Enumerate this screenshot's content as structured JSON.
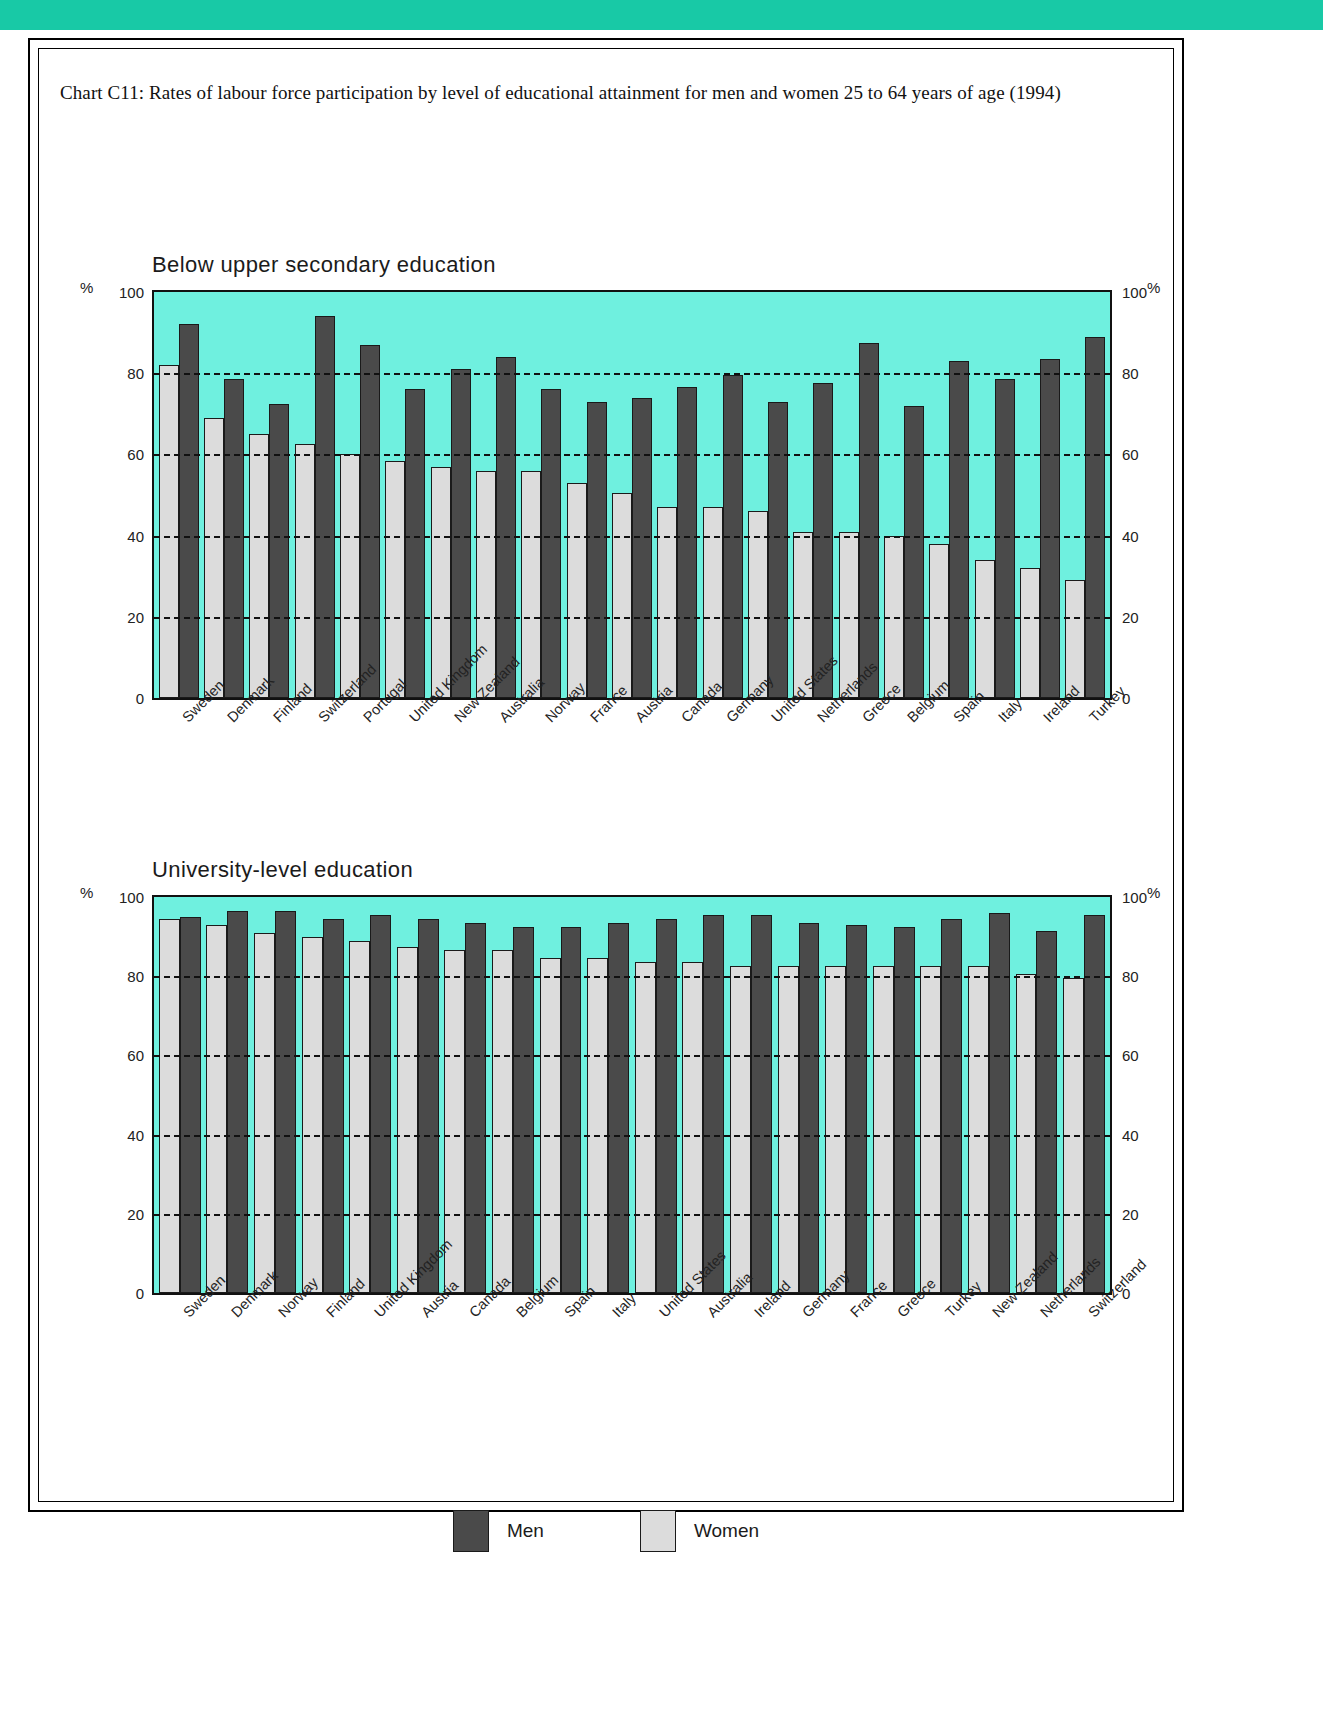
{
  "page": {
    "chart_caption": "Chart C11: Rates of labour force participation by level of educational attainment for men and women 25 to 64 years of age (1994)",
    "accent_color": "#18c9a6",
    "plot_background": "#6ff0df",
    "men_color": "#4a4a4a",
    "women_color": "#dcdcdc"
  },
  "legend": {
    "men_label": "Men",
    "women_label": "Women"
  },
  "axis": {
    "percent_symbol": "%",
    "ticks": [
      "100",
      "80",
      "60",
      "40",
      "20",
      "0"
    ],
    "tick_values": [
      100,
      80,
      60,
      40,
      20,
      0
    ]
  },
  "chart_data": [
    {
      "type": "bar",
      "title": "Below upper secondary education",
      "xlabel": "",
      "ylabel": "%",
      "ylim": [
        0,
        100
      ],
      "yticks": [
        0,
        20,
        40,
        60,
        80,
        100
      ],
      "grid": true,
      "legend_position": "bottom",
      "categories": [
        "Sweden",
        "Denmark",
        "Finland",
        "Switzerland",
        "Portugal",
        "United Kingdom",
        "New Zealand",
        "Australia",
        "Norway",
        "France",
        "Austria",
        "Canada",
        "Germany",
        "United States",
        "Netherlands",
        "Greece",
        "Belgium",
        "Spain",
        "Italy",
        "Ireland",
        "Turkey"
      ],
      "series": [
        {
          "name": "Women",
          "values": [
            82,
            69,
            65,
            62.5,
            60,
            58.5,
            57,
            56,
            56,
            53,
            50.5,
            47,
            47,
            46,
            41,
            41,
            40,
            38,
            34,
            32,
            29
          ]
        },
        {
          "name": "Men",
          "values": [
            92,
            78.5,
            72.5,
            94,
            87,
            76,
            81,
            84,
            76,
            73,
            74,
            76.5,
            79.5,
            73,
            77.5,
            87.5,
            72,
            83,
            78.5,
            83.5,
            89
          ]
        }
      ]
    },
    {
      "type": "bar",
      "title": "University-level education",
      "xlabel": "",
      "ylabel": "%",
      "ylim": [
        0,
        100
      ],
      "yticks": [
        0,
        20,
        40,
        60,
        80,
        100
      ],
      "grid": true,
      "legend_position": "bottom",
      "categories": [
        "Sweden",
        "Denmark",
        "Norway",
        "Finland",
        "United Kingdom",
        "Austria",
        "Canada",
        "Belgium",
        "Spain",
        "Italy",
        "United States",
        "Australia",
        "Ireland",
        "Germany",
        "France",
        "Greece",
        "Turkey",
        "New Zealand",
        "Netherlands",
        "Switzerland"
      ],
      "series": [
        {
          "name": "Women",
          "values": [
            94.5,
            93,
            91,
            90,
            89,
            87.5,
            86.5,
            86.5,
            84.5,
            84.5,
            83.5,
            83.5,
            82.5,
            82.5,
            82.5,
            82.5,
            82.5,
            82.5,
            80.5,
            79.5
          ]
        },
        {
          "name": "Men",
          "values": [
            95,
            96.5,
            96.5,
            94.5,
            95.5,
            94.5,
            93.5,
            92.5,
            92.5,
            93.5,
            94.5,
            95.5,
            95.5,
            93.5,
            93,
            92.5,
            94.5,
            96,
            91.5,
            95.5
          ]
        }
      ]
    }
  ]
}
